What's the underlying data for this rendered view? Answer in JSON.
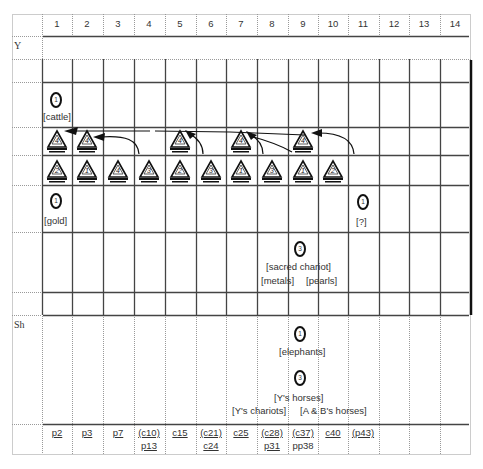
{
  "diagram": {
    "columns": [
      "1",
      "2",
      "3",
      "4",
      "5",
      "6",
      "7",
      "8",
      "9",
      "10",
      "11",
      "12",
      "13",
      "14"
    ],
    "row_labels": {
      "y": "Y",
      "sh": "Sh"
    },
    "circles": [
      {
        "id": "cattle",
        "number": "1",
        "label": "[cattle]",
        "column": 1
      },
      {
        "id": "gold",
        "number": "1",
        "label": "[gold]",
        "column": 1
      },
      {
        "id": "unknown",
        "number": "1",
        "label": "[?]",
        "column": 11
      },
      {
        "id": "sacred-chariot",
        "number": "3",
        "label": "[sacred chariot]",
        "sublabels": [
          "[metals]",
          "[pearls]"
        ],
        "column": 9
      },
      {
        "id": "elephants",
        "number": "1",
        "label": "[elephants]",
        "column": 9
      },
      {
        "id": "horses",
        "number": "3",
        "label": "[Y's horses]",
        "sublabels": [
          "[Y's chariots]",
          "[A & B's horses]"
        ],
        "column": 9
      }
    ],
    "triangles_upper": [
      {
        "column": 1,
        "number": "4"
      },
      {
        "column": 2,
        "number": "4"
      },
      {
        "column": 5,
        "number": "4"
      },
      {
        "column": 7,
        "number": "4"
      },
      {
        "column": 9,
        "number": "4"
      }
    ],
    "triangles_lower": [
      {
        "column": 1,
        "number": "2"
      },
      {
        "column": 2,
        "number": "1"
      },
      {
        "column": 3,
        "number": "4"
      },
      {
        "column": 4,
        "number": "3"
      },
      {
        "column": 5,
        "number": "2"
      },
      {
        "column": 6,
        "number": "3"
      },
      {
        "column": 7,
        "number": "1"
      },
      {
        "column": 8,
        "number": "3"
      },
      {
        "column": 9,
        "number": "1"
      },
      {
        "column": 10,
        "number": "2"
      }
    ],
    "footer": [
      {
        "column": 1,
        "line1": "p2"
      },
      {
        "column": 2,
        "line1": "p3"
      },
      {
        "column": 3,
        "line1": "p7"
      },
      {
        "column": 4,
        "line1": "(c10)",
        "line2": "p13"
      },
      {
        "column": 5,
        "line1": "c15"
      },
      {
        "column": 6,
        "line1": "(c21)",
        "line2": "c24"
      },
      {
        "column": 7,
        "line1": "c25"
      },
      {
        "column": 8,
        "line1": "(c28)",
        "line2": "p31"
      },
      {
        "column": 9,
        "line1": "(c37)",
        "line2": "pp38"
      },
      {
        "column": 10,
        "line1": "c40"
      },
      {
        "column": 11,
        "line1": "(p43)"
      }
    ]
  }
}
